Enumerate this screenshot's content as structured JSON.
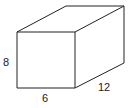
{
  "diagram": {
    "type": "rectangular-prism",
    "labels": {
      "height": "8",
      "width": "6",
      "depth": "12"
    },
    "colors": {
      "stroke": "#222222",
      "background": "#ffffff"
    }
  }
}
